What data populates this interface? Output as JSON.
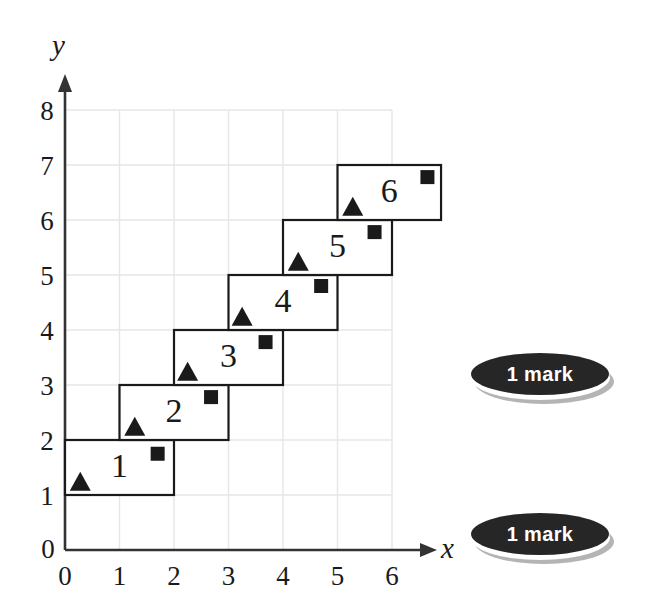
{
  "figure": {
    "axis_x_label": "x",
    "axis_y_label": "y",
    "origin_label": "0"
  },
  "chart_data": {
    "type": "scatter",
    "title": "",
    "xlabel": "x",
    "ylabel": "y",
    "xlim": [
      0,
      6
    ],
    "ylim": [
      0,
      8
    ],
    "xticks": [
      "0",
      "1",
      "2",
      "3",
      "4",
      "5",
      "6"
    ],
    "yticks": [
      "0",
      "1",
      "2",
      "3",
      "4",
      "5",
      "6",
      "7",
      "8"
    ],
    "grid": true,
    "legend": "none",
    "boxes": [
      {
        "label": "1",
        "x0": 0,
        "x1": 2,
        "y0": 1,
        "y1": 2,
        "label_x": 1.0,
        "label_y": 1.55
      },
      {
        "label": "2",
        "x0": 1,
        "x1": 3,
        "y0": 2,
        "y1": 3,
        "label_x": 2.0,
        "label_y": 2.55
      },
      {
        "label": "3",
        "x0": 2,
        "x1": 4,
        "y0": 3,
        "y1": 4,
        "label_x": 3.0,
        "label_y": 3.55
      },
      {
        "label": "4",
        "x0": 3,
        "x1": 5,
        "y0": 4,
        "y1": 5,
        "label_x": 4.0,
        "label_y": 4.55
      },
      {
        "label": "5",
        "x0": 4,
        "x1": 6,
        "y0": 5,
        "y1": 6,
        "label_x": 5.0,
        "label_y": 5.55
      },
      {
        "label": "6",
        "x0": 5,
        "x1": 6.9,
        "y0": 6,
        "y1": 7,
        "label_x": 5.95,
        "label_y": 6.55
      }
    ],
    "series": [
      {
        "name": "triangle-markers",
        "marker": "triangle",
        "color": "#1a1a1a",
        "points": [
          {
            "x": 0.28,
            "y": 1.25
          },
          {
            "x": 1.28,
            "y": 2.25
          },
          {
            "x": 2.25,
            "y": 3.25
          },
          {
            "x": 3.25,
            "y": 4.25
          },
          {
            "x": 4.28,
            "y": 5.25
          },
          {
            "x": 5.28,
            "y": 6.25
          }
        ]
      },
      {
        "name": "square-markers",
        "marker": "square",
        "color": "#1a1a1a",
        "points": [
          {
            "x": 1.7,
            "y": 1.75
          },
          {
            "x": 2.68,
            "y": 2.78
          },
          {
            "x": 3.68,
            "y": 3.78
          },
          {
            "x": 4.7,
            "y": 4.8
          },
          {
            "x": 5.68,
            "y": 5.78
          },
          {
            "x": 6.65,
            "y": 6.78
          }
        ]
      }
    ]
  },
  "badges": [
    {
      "id": "badge-1",
      "text": "1 mark"
    },
    {
      "id": "badge-2",
      "text": "1 mark"
    }
  ],
  "colors": {
    "ink": "#1a1a1a",
    "grid": "#e6e6e6",
    "axis": "#333333",
    "badge_fill": "#262626",
    "badge_text": "#ffffff",
    "badge_shadow": "#b4b4b4"
  }
}
